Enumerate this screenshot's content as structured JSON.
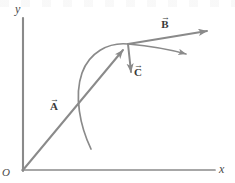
{
  "figure": {
    "background_color": "#ffffff",
    "line_color": "#8a8a8a",
    "axis_color": "#8a8a8a",
    "text_color": "#3a3a3a",
    "width": 235,
    "height": 183
  },
  "axes": {
    "x_label": "x",
    "y_label": "y",
    "origin_label": "O",
    "origin_point": [
      23,
      170
    ],
    "x_axis_end": [
      215,
      170
    ],
    "y_axis_top": [
      23,
      18
    ]
  },
  "vectors": [
    {
      "name": "A",
      "label": "A",
      "arrow_overscript": "→",
      "tail": [
        23,
        170
      ],
      "head": [
        128,
        44
      ],
      "description": "Vector A from origin to the common point"
    },
    {
      "name": "B",
      "label": "B",
      "arrow_overscript": "→",
      "tail": [
        128,
        44
      ],
      "head": [
        215,
        30
      ],
      "description": "Vector B pointing up and to the right from the common point"
    },
    {
      "name": "C",
      "label": "C",
      "arrow_overscript": "→",
      "tail": [
        128,
        44
      ],
      "head": [
        132,
        79
      ],
      "description": "Vector C pointing downward from the common point"
    }
  ],
  "curve": {
    "name": "trajectory",
    "description": "Curved path passing through the common point, rising from lower left and continuing to the right with an arrowhead",
    "start_point": [
      91,
      149
    ],
    "through_point": [
      128,
      44
    ],
    "end_point": [
      192,
      55
    ],
    "arrowhead_at": [
      192,
      55
    ]
  }
}
